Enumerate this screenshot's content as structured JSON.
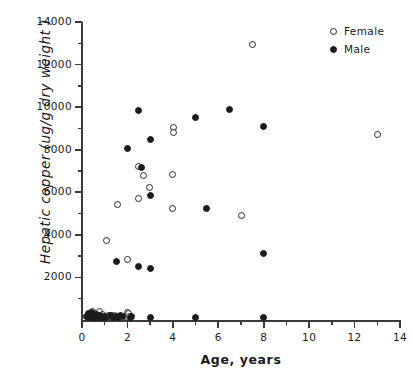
{
  "chart_data": {
    "type": "scatter",
    "title": "",
    "xlabel": "Age,  years",
    "ylabel": "Hepatic copper  (ug/g dry weight )",
    "xlim": [
      0,
      14
    ],
    "ylim": [
      0,
      14000
    ],
    "xticks": [
      0,
      2,
      4,
      6,
      8,
      10,
      12,
      14
    ],
    "xticklabels": [
      "0",
      "2",
      "4",
      "6",
      "8",
      "10",
      "12",
      "14"
    ],
    "xminor_step": 1,
    "yticks": [
      0,
      2000,
      4000,
      6000,
      8000,
      10000,
      12000,
      14000
    ],
    "yticklabels": [
      "",
      "2000",
      "4000",
      "6000",
      "8000",
      "10000",
      "12000",
      "14000"
    ],
    "yminor_step": 1000,
    "grid": false,
    "legend_position": "top-right",
    "spines": [
      "left",
      "bottom"
    ],
    "series": [
      {
        "name": "Female",
        "marker": "open-circle",
        "color": "#2a2a2a",
        "points": [
          [
            0.35,
            250
          ],
          [
            0.45,
            400
          ],
          [
            0.6,
            300
          ],
          [
            0.75,
            420
          ],
          [
            0.9,
            240
          ],
          [
            1.15,
            210
          ],
          [
            1.3,
            230
          ],
          [
            1.45,
            200
          ],
          [
            1.9,
            180
          ],
          [
            2.0,
            330
          ],
          [
            2.05,
            300
          ],
          [
            2.1,
            170
          ],
          [
            1.1,
            3730
          ],
          [
            1.55,
            5440
          ],
          [
            2.0,
            2860
          ],
          [
            2.5,
            5690
          ],
          [
            2.5,
            7210
          ],
          [
            2.7,
            6780
          ],
          [
            2.95,
            6240
          ],
          [
            4.0,
            5250
          ],
          [
            4.0,
            6830
          ],
          [
            4.05,
            9050
          ],
          [
            4.05,
            8830
          ],
          [
            7.0,
            4890
          ],
          [
            7.5,
            12920
          ],
          [
            13.0,
            8700
          ]
        ]
      },
      {
        "name": "Male",
        "marker": "filled-circle",
        "color": "#1c1c1c",
        "points": [
          [
            0.2,
            180
          ],
          [
            0.3,
            120
          ],
          [
            0.3,
            300
          ],
          [
            0.35,
            200
          ],
          [
            0.4,
            150
          ],
          [
            0.4,
            330
          ],
          [
            0.45,
            120
          ],
          [
            0.5,
            250
          ],
          [
            0.5,
            160
          ],
          [
            0.55,
            100
          ],
          [
            0.6,
            200
          ],
          [
            0.6,
            130
          ],
          [
            0.65,
            260
          ],
          [
            0.7,
            150
          ],
          [
            0.75,
            110
          ],
          [
            0.8,
            210
          ],
          [
            0.85,
            140
          ],
          [
            0.9,
            120
          ],
          [
            1.0,
            160
          ],
          [
            1.05,
            130
          ],
          [
            1.2,
            150
          ],
          [
            1.25,
            190
          ],
          [
            1.35,
            170
          ],
          [
            1.4,
            140
          ],
          [
            1.5,
            160
          ],
          [
            1.6,
            130
          ],
          [
            1.7,
            200
          ],
          [
            1.8,
            150
          ],
          [
            2.15,
            140
          ],
          [
            2.2,
            180
          ],
          [
            3.0,
            120
          ],
          [
            5.0,
            110
          ],
          [
            8.0,
            130
          ],
          [
            1.5,
            2740
          ],
          [
            2.5,
            2510
          ],
          [
            3.0,
            2430
          ],
          [
            2.0,
            8080
          ],
          [
            2.5,
            9840
          ],
          [
            2.6,
            7160
          ],
          [
            3.0,
            8500
          ],
          [
            3.0,
            5840
          ],
          [
            5.0,
            9510
          ],
          [
            5.5,
            5260
          ],
          [
            6.5,
            9910
          ],
          [
            8.0,
            9100
          ],
          [
            8.0,
            3140
          ]
        ]
      }
    ]
  },
  "legend": {
    "items": [
      {
        "label": "Female",
        "marker": "open-circle"
      },
      {
        "label": "Male",
        "marker": "filled-circle"
      }
    ]
  }
}
